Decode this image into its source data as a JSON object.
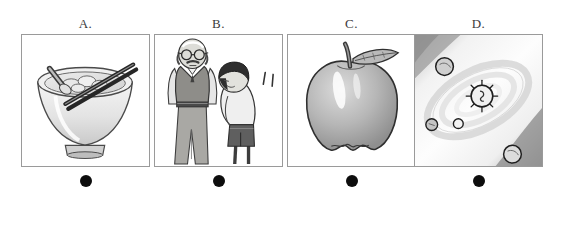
{
  "question": {
    "type": "multiple-choice-image-options",
    "option_count": 4
  },
  "options": [
    {
      "key": "A",
      "label": "A.",
      "illustration": "bowl-of-soup-with-spoon-and-chopsticks",
      "selected": false,
      "bullet": "filled-circle"
    },
    {
      "key": "B",
      "label": "B.",
      "illustration": "elderly-man-and-bowing-child",
      "selected": false,
      "bullet": "filled-circle"
    },
    {
      "key": "C",
      "label": "C.",
      "illustration": "apple-with-stem-and-leaf",
      "selected": false,
      "bullet": "filled-circle"
    },
    {
      "key": "D",
      "label": "D.",
      "illustration": "solar-system-with-sun-and-planets",
      "selected": false,
      "bullet": "filled-circle"
    }
  ],
  "colors": {
    "background": "#ffffff",
    "panel_border": "#9a9a9a",
    "label_text": "#3a3a3a",
    "bullet": "#0d0d0d",
    "ink": "#2b2b2b",
    "mid_gray": "#9d9d9d",
    "light_gray": "#d9d9d9",
    "dark_gray": "#5a5a5a"
  }
}
